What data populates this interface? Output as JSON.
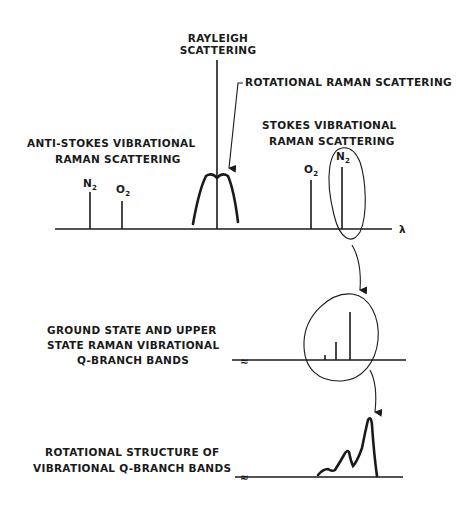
{
  "diagram": {
    "top_spectrum": {
      "rayleigh_label": [
        "RAYLEIGH",
        "SCATTERING"
      ],
      "rotational_label": "ROTATIONAL  RAMAN SCATTERING",
      "anti_stokes_label": [
        "ANTI-STOKES VIBRATIONAL",
        "RAMAN SCATTERING"
      ],
      "stokes_label": [
        "STOKES VIBRATIONAL",
        "RAMAN SCATTERING"
      ],
      "axis_symbol": "λ",
      "anti_stokes_lines": [
        {
          "species": "N",
          "subscript": "2"
        },
        {
          "species": "O",
          "subscript": "2"
        }
      ],
      "stokes_lines": [
        {
          "species": "O",
          "subscript": "2"
        },
        {
          "species": "N",
          "subscript": "2"
        }
      ]
    },
    "middle_spectrum": {
      "label": [
        "GROUND STATE AND UPPER",
        "STATE RAMAN VIBRATIONAL",
        "Q-BRANCH BANDS"
      ],
      "break_symbol": "≈"
    },
    "bottom_spectrum": {
      "label": [
        "ROTATIONAL STRUCTURE OF",
        "VIBRATIONAL Q-BRANCH BANDS"
      ],
      "break_symbol": "≈"
    }
  }
}
